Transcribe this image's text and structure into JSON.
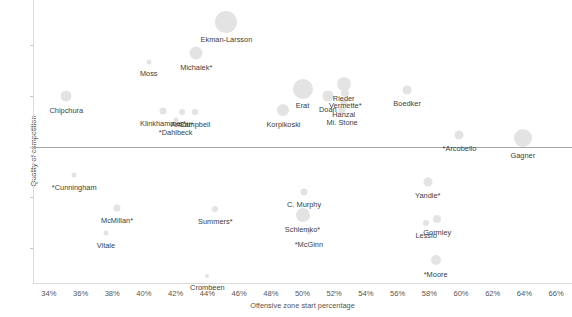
{
  "chart_data": {
    "type": "scatter",
    "title": "Arizona Coyotes player usage chart",
    "xlabel": "Offensive zone start percentage",
    "ylabel": "Quality of competition",
    "xlim": [
      33,
      67
    ],
    "ylim": [
      -1.35,
      1.45
    ],
    "xticks": [
      "34%",
      "36%",
      "38%",
      "40%",
      "42%",
      "44%",
      "46%",
      "48%",
      "50%",
      "52%",
      "54%",
      "56%",
      "58%",
      "60%",
      "62%",
      "64%",
      "66%"
    ],
    "xtick_values": [
      34,
      36,
      38,
      40,
      42,
      44,
      46,
      48,
      50,
      52,
      54,
      56,
      58,
      60,
      62,
      64,
      66
    ],
    "yticks": [
      "1.0",
      "0.5",
      "0.0",
      "-0.5",
      "-1.0"
    ],
    "ytick_values": [
      1.0,
      0.5,
      0.0,
      -0.5,
      -1.0
    ],
    "grid": false,
    "legend": "none",
    "zero_reference_line": 0.0,
    "bubble_color": "#e3e3e3",
    "size_meaning": "bubble size scales with ice time / shot attempt differential",
    "points": [
      {
        "name": "Ekman-Larsson",
        "x": 45.2,
        "y": 1.23,
        "size": 22,
        "label_dx": 0,
        "label_dy": 13
      },
      {
        "name": "Michalek*",
        "x": 43.3,
        "y": 0.93,
        "size": 13,
        "label_dx": 0,
        "label_dy": 10
      },
      {
        "name": "Moss",
        "x": 40.3,
        "y": 0.84,
        "size": 5,
        "label_dx": 0,
        "label_dy": 7
      },
      {
        "name": "Chipchura",
        "x": 35.1,
        "y": 0.5,
        "size": 11,
        "label_dx": 0,
        "label_dy": 10
      },
      {
        "name": "Klinkhammer*",
        "x": 41.2,
        "y": 0.35,
        "size": 7,
        "label_dx": 0,
        "label_dy": 8
      },
      {
        "name": "Arnott*",
        "x": 42.4,
        "y": 0.34,
        "size": 6,
        "label_dx": 0,
        "label_dy": 8
      },
      {
        "name": "Campbell",
        "x": 43.2,
        "y": 0.34,
        "size": 6,
        "label_dx": 0,
        "label_dy": 8
      },
      {
        "name": "*Dahlbeck",
        "x": 42.0,
        "y": 0.26,
        "size": 5,
        "label_dx": 0,
        "label_dy": 8
      },
      {
        "name": "Korpikoski",
        "x": 48.8,
        "y": 0.36,
        "size": 12,
        "label_dx": 0,
        "label_dy": 10
      },
      {
        "name": "Erat",
        "x": 50.0,
        "y": 0.57,
        "size": 20,
        "label_dx": 0,
        "label_dy": 12
      },
      {
        "name": "Doan",
        "x": 51.6,
        "y": 0.5,
        "size": 11,
        "label_dx": 0,
        "label_dy": 9
      },
      {
        "name": "Rieder",
        "x": 52.6,
        "y": 0.62,
        "size": 14,
        "label_dx": 0,
        "label_dy": 10
      },
      {
        "name": "Vermette*",
        "x": 52.7,
        "y": 0.53,
        "size": 8,
        "label_dx": 0,
        "label_dy": 8
      },
      {
        "name": "Hanzal",
        "x": 52.6,
        "y": 0.44,
        "size": 7,
        "label_dx": 0,
        "label_dy": 8
      },
      {
        "name": "Mi. Stone",
        "x": 52.5,
        "y": 0.36,
        "size": 7,
        "label_dx": 0,
        "label_dy": 8
      },
      {
        "name": "Boedker",
        "x": 56.6,
        "y": 0.56,
        "size": 9,
        "label_dx": 0,
        "label_dy": 9
      },
      {
        "name": "*Arcobello",
        "x": 59.9,
        "y": 0.11,
        "size": 9,
        "label_dx": 0,
        "label_dy": 9
      },
      {
        "name": "Gagner",
        "x": 63.9,
        "y": 0.08,
        "size": 18,
        "label_dx": 0,
        "label_dy": 13
      },
      {
        "name": "*Cunningham",
        "x": 35.6,
        "y": -0.28,
        "size": 5,
        "label_dx": 0,
        "label_dy": 8
      },
      {
        "name": "McMillan*",
        "x": 38.3,
        "y": -0.61,
        "size": 7,
        "label_dx": 0,
        "label_dy": 8
      },
      {
        "name": "Vitale",
        "x": 37.6,
        "y": -0.86,
        "size": 5,
        "label_dx": 0,
        "label_dy": 8
      },
      {
        "name": "Summers*",
        "x": 44.5,
        "y": -0.62,
        "size": 6,
        "label_dx": 0,
        "label_dy": 8
      },
      {
        "name": "C. Murphy",
        "x": 50.1,
        "y": -0.45,
        "size": 7,
        "label_dx": 0,
        "label_dy": 8
      },
      {
        "name": "Schlemko*",
        "x": 50.0,
        "y": -0.68,
        "size": 14,
        "label_dx": 0,
        "label_dy": 10
      },
      {
        "name": "*McGinn",
        "x": 50.4,
        "y": -0.85,
        "size": 5,
        "label_dx": 0,
        "label_dy": 8
      },
      {
        "name": "Yandle*",
        "x": 57.9,
        "y": -0.35,
        "size": 9,
        "label_dx": 0,
        "label_dy": 9
      },
      {
        "name": "Gormley",
        "x": 58.5,
        "y": -0.72,
        "size": 8,
        "label_dx": 0,
        "label_dy": 9
      },
      {
        "name": "Lessio",
        "x": 57.8,
        "y": -0.76,
        "size": 6,
        "label_dx": 0,
        "label_dy": 8
      },
      {
        "name": "*Moore",
        "x": 58.4,
        "y": -1.12,
        "size": 10,
        "label_dx": 0,
        "label_dy": 10
      },
      {
        "name": "Crombeen",
        "x": 44.0,
        "y": -1.28,
        "size": 4,
        "label_dx": 0,
        "label_dy": 7
      }
    ]
  }
}
